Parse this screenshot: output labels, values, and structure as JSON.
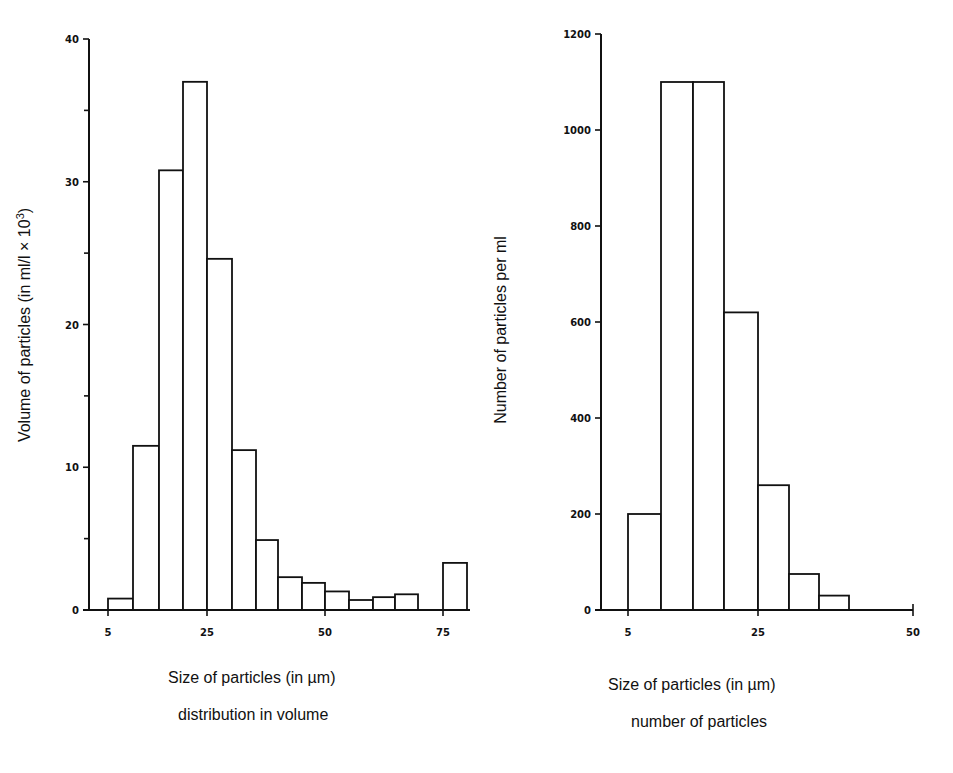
{
  "chart_data": [
    {
      "type": "bar",
      "subtype": "histogram",
      "title": "",
      "xlabel": "Size of particles (in µm)",
      "subcaption": "distribution in volume",
      "ylabel": "Volume of particles (in ml/l × 10³)",
      "ylabel_sup": "3",
      "xlim": [
        5,
        80
      ],
      "ylim": [
        0,
        40
      ],
      "x_ticks": [
        5,
        25,
        50,
        75
      ],
      "y_ticks": [
        0,
        10,
        20,
        30,
        40
      ],
      "y_minor_ticks": [
        5,
        15,
        25,
        35
      ],
      "bin_width": 5,
      "bins": [
        {
          "from": 5,
          "to": 10,
          "value": 0.8
        },
        {
          "from": 10,
          "to": 15,
          "value": 11.5
        },
        {
          "from": 15,
          "to": 20,
          "value": 30.8
        },
        {
          "from": 20,
          "to": 25,
          "value": 37.0
        },
        {
          "from": 25,
          "to": 30,
          "value": 24.6
        },
        {
          "from": 30,
          "to": 35,
          "value": 11.2
        },
        {
          "from": 35,
          "to": 40,
          "value": 4.9
        },
        {
          "from": 40,
          "to": 45,
          "value": 2.3
        },
        {
          "from": 45,
          "to": 50,
          "value": 1.9
        },
        {
          "from": 50,
          "to": 55,
          "value": 1.3
        },
        {
          "from": 55,
          "to": 60,
          "value": 0.7
        },
        {
          "from": 60,
          "to": 65,
          "value": 0.9
        },
        {
          "from": 65,
          "to": 70,
          "value": 1.1
        },
        {
          "from": 70,
          "to": 75,
          "value": 0
        },
        {
          "from": 75,
          "to": 80,
          "value": 3.3
        }
      ],
      "grid": false,
      "legend": null
    },
    {
      "type": "bar",
      "subtype": "histogram",
      "title": "",
      "xlabel": "Size of particles (in µm)",
      "subcaption": "number of particles",
      "ylabel": "Number of particles per ml",
      "xlim": [
        0,
        50
      ],
      "ylim": [
        0,
        1200
      ],
      "x_ticks": [
        5,
        25,
        50
      ],
      "y_ticks": [
        0,
        200,
        400,
        600,
        800,
        1000,
        1200
      ],
      "bin_width": 5,
      "bins": [
        {
          "from": 5,
          "to": 10,
          "value": 200
        },
        {
          "from": 10,
          "to": 15,
          "value": 1100
        },
        {
          "from": 15,
          "to": 20,
          "value": 1100
        },
        {
          "from": 20,
          "to": 25,
          "value": 620
        },
        {
          "from": 25,
          "to": 30,
          "value": 260
        },
        {
          "from": 30,
          "to": 35,
          "value": 75
        },
        {
          "from": 35,
          "to": 40,
          "value": 30
        }
      ],
      "grid": false,
      "legend": null
    }
  ],
  "layout": {
    "charts": [
      {
        "axis_x": 89,
        "y_top": 39,
        "y_zero": 610,
        "x_end": 470,
        "x_px": {
          "5": 108,
          "10": 133,
          "15": 159,
          "20": 183,
          "25": 207,
          "30": 232,
          "35": 256,
          "40": 278,
          "45": 302,
          "50": 325,
          "55": 349,
          "60": 373,
          "65": 395,
          "70": 418,
          "75": 443,
          "80": 467
        },
        "caption_x": 168,
        "caption_y": 683,
        "sub_x": 178,
        "sub_y": 720,
        "ylabel_x": 22,
        "ylabel_cy": 325
      },
      {
        "axis_x": 601,
        "y_top": 34,
        "y_zero": 610,
        "x_end": 913,
        "x_px": {
          "5": 628,
          "10": 661,
          "15": 693,
          "20": 724,
          "25": 758,
          "30": 789,
          "35": 819,
          "40": 849,
          "50": 913
        },
        "caption_x": 608,
        "caption_y": 690,
        "sub_x": 631,
        "sub_y": 727,
        "ylabel_x": 498,
        "ylabel_cy": 330
      }
    ]
  }
}
